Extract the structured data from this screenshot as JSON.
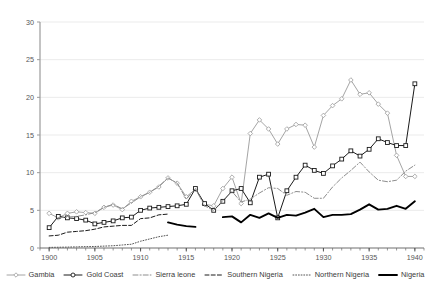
{
  "chart_data": {
    "type": "line",
    "title": "",
    "subtitle": "",
    "xlabel": "",
    "ylabel": "",
    "xlim": [
      1899,
      1941
    ],
    "ylim": [
      0,
      30
    ],
    "ytick_values": [
      0,
      5,
      10,
      15,
      20,
      25,
      30
    ],
    "ytick_labels": [
      "0",
      "5",
      "10",
      "15",
      "20",
      "25",
      "30"
    ],
    "xtick_values": [
      1900,
      1905,
      1910,
      1915,
      1920,
      1925,
      1930,
      1935,
      1940
    ],
    "xtick_labels": [
      "1900",
      "1905",
      "1910",
      "1915",
      "1920",
      "1925",
      "1930",
      "1935",
      "1940"
    ],
    "xtick_minor_step": 1,
    "grid": "horizontal",
    "legend_position": "bottom",
    "series": [
      {
        "name": "Gambia",
        "color": "#9a9a9a",
        "marker": "diamond",
        "dash": "solid",
        "width": 0.9,
        "x": [
          1900,
          1901,
          1902,
          1903,
          1904,
          1905,
          1906,
          1907,
          1908,
          1909,
          1910,
          1911,
          1912,
          1913,
          1914,
          1915,
          1916,
          1917,
          1918,
          1919,
          1920,
          1921,
          1922,
          1923,
          1924,
          1925,
          1926,
          1927,
          1928,
          1929,
          1930,
          1931,
          1932,
          1933,
          1934,
          1935,
          1936,
          1937,
          1938,
          1939,
          1940
        ],
        "y": [
          4.6,
          4.0,
          4.6,
          4.8,
          4.7,
          4.6,
          5.4,
          5.7,
          5.1,
          6.2,
          6.8,
          7.4,
          8.1,
          9.3,
          8.6,
          6.8,
          7.8,
          5.8,
          5.6,
          7.9,
          9.4,
          5.9,
          15.2,
          17.0,
          15.8,
          13.8,
          15.8,
          16.4,
          16.3,
          13.4,
          17.6,
          18.9,
          19.8,
          22.3,
          20.4,
          20.6,
          19.1,
          17.9,
          12.3,
          9.5,
          9.5
        ]
      },
      {
        "name": "Gold Coast",
        "color": "#1a1a1a",
        "marker": "square",
        "dash": "solid",
        "width": 1.0,
        "x": [
          1900,
          1901,
          1902,
          1903,
          1904,
          1905,
          1906,
          1907,
          1908,
          1909,
          1910,
          1911,
          1912,
          1913,
          1914,
          1915,
          1916,
          1917,
          1918,
          1919,
          1920,
          1921,
          1922,
          1923,
          1924,
          1925,
          1926,
          1927,
          1928,
          1929,
          1930,
          1931,
          1932,
          1933,
          1934,
          1935,
          1936,
          1937,
          1938,
          1939,
          1940
        ],
        "y": [
          2.7,
          4.2,
          4.0,
          3.9,
          3.7,
          3.2,
          3.4,
          3.6,
          4.0,
          4.1,
          5.0,
          5.3,
          5.4,
          5.5,
          5.6,
          5.8,
          7.9,
          5.9,
          5.0,
          6.2,
          7.6,
          7.9,
          6.0,
          9.4,
          9.8,
          4.0,
          7.6,
          9.4,
          11.0,
          10.3,
          9.9,
          10.9,
          11.8,
          12.9,
          12.2,
          13.1,
          14.5,
          14.0,
          13.6,
          13.6,
          21.8
        ]
      },
      {
        "name": "Sierra leone",
        "color": "#8d8d8d",
        "marker": "none",
        "dash": "dashdot",
        "width": 1.0,
        "x": [
          1901,
          1902,
          1903,
          1904,
          1905,
          1906,
          1907,
          1908,
          1909,
          1910,
          1911,
          1912,
          1913,
          1914,
          1915,
          1916,
          1917,
          1918,
          1919,
          1920,
          1921,
          1922,
          1923,
          1924,
          1925,
          1926,
          1927,
          1928,
          1929,
          1930,
          1931,
          1932,
          1933,
          1934,
          1935,
          1936,
          1937,
          1938,
          1939,
          1940
        ],
        "y": [
          4.0,
          4.1,
          4.2,
          4.4,
          4.7,
          5.4,
          5.8,
          5.2,
          6.0,
          6.8,
          7.4,
          8.2,
          9.3,
          8.6,
          6.5,
          7.9,
          5.6,
          5.0,
          6.3,
          7.5,
          6.1,
          6.5,
          7.3,
          8.0,
          7.9,
          7.0,
          7.5,
          7.4,
          6.6,
          6.6,
          8.1,
          9.3,
          10.3,
          11.4,
          10.1,
          9.0,
          8.8,
          9.0,
          10.2,
          11.0
        ]
      },
      {
        "name": "Southern Nigeria",
        "color": "#1a1a1a",
        "marker": "none",
        "dash": "dashed",
        "width": 1.0,
        "x": [
          1900,
          1901,
          1902,
          1903,
          1904,
          1905,
          1906,
          1907,
          1908,
          1909,
          1910,
          1911,
          1912,
          1913
        ],
        "y": [
          1.6,
          1.7,
          2.1,
          2.2,
          2.3,
          2.5,
          2.8,
          2.9,
          3.0,
          3.0,
          3.9,
          4.0,
          4.4,
          4.5
        ]
      },
      {
        "name": "Northern Nigeria",
        "color": "#555555",
        "marker": "none",
        "dash": "dotted",
        "width": 1.0,
        "x": [
          1900,
          1901,
          1902,
          1903,
          1904,
          1905,
          1906,
          1907,
          1908,
          1909,
          1910,
          1911,
          1912,
          1913
        ],
        "y": [
          0.08,
          0.1,
          0.12,
          0.15,
          0.18,
          0.2,
          0.25,
          0.3,
          0.4,
          0.5,
          0.9,
          1.2,
          1.5,
          1.7
        ]
      },
      {
        "name": "Nigeria",
        "color": "#000000",
        "marker": "none",
        "dash": "solid",
        "width": 1.9,
        "segments": [
          {
            "x": [
              1913,
              1914,
              1915,
              1916
            ],
            "y": [
              3.4,
              3.1,
              2.9,
              2.8
            ]
          },
          {
            "x": [
              1919,
              1920,
              1921,
              1922,
              1923,
              1924,
              1925,
              1926,
              1927,
              1928,
              1929,
              1930,
              1931,
              1932,
              1933,
              1934,
              1935,
              1936,
              1937,
              1938,
              1939,
              1940
            ],
            "y": [
              4.1,
              4.2,
              3.4,
              4.4,
              4.0,
              4.6,
              4.0,
              4.4,
              4.3,
              4.7,
              5.2,
              4.1,
              4.4,
              4.4,
              4.5,
              5.1,
              5.8,
              5.1,
              5.2,
              5.6,
              5.2,
              6.2
            ]
          }
        ]
      }
    ]
  },
  "legend": {
    "items": [
      {
        "label": "Gambia",
        "swatch": "line-diamond-marker"
      },
      {
        "label": "Gold Coast",
        "swatch": "line-square-marker"
      },
      {
        "label": "Sierra leone",
        "swatch": "line-dashdot"
      },
      {
        "label": "Southern Nigeria",
        "swatch": "line-dashed"
      },
      {
        "label": "Northern Nigeria",
        "swatch": "line-dotted"
      },
      {
        "label": "Nigeria",
        "swatch": "line-thick-solid"
      }
    ]
  }
}
